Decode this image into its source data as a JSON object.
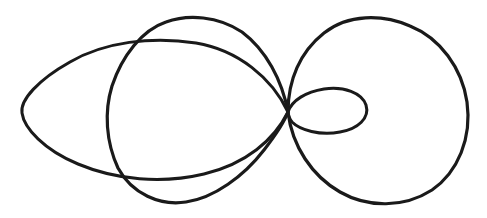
{
  "figure": {
    "kind": "hand-drawn-line-drawing",
    "background_color": "#ffffff",
    "stroke_color": "#1a1a1a",
    "canvas": {
      "width": 487,
      "height": 218
    },
    "node_point": {
      "x": 288,
      "y": 112
    },
    "curves": [
      {
        "name": "wide-flat-oval",
        "role": "leftmost large flattened oval tapering to the node",
        "stroke_width": 3.0,
        "bbox": {
          "x_min": 22,
          "y_min": 43,
          "x_max": 288,
          "y_max": 178
        },
        "path": "M 288 112 C 272 78 238 50 196 43 C 152 36 104 42 70 62 C 38 80 20 100 22 113 C 24 128 44 150 78 164 C 116 180 162 184 204 174 C 246 164 274 140 288 112 Z"
      },
      {
        "name": "egg-teardrop-curve",
        "role": "middle egg shape, rounded at left and pointed at the node",
        "stroke_width": 3.2,
        "bbox": {
          "x_min": 108,
          "y_min": 18,
          "x_max": 288,
          "y_max": 202
        },
        "path": "M 288 112 C 282 80 266 50 242 32 C 218 16 188 14 166 22 C 142 30 122 56 112 86 C 104 112 106 142 118 168 C 132 194 160 206 186 202 C 214 198 244 176 264 150 C 278 132 285 120 288 112 Z"
      },
      {
        "name": "large-right-circle",
        "role": "large circle on the right, tangent at the node",
        "stroke_width": 3.2,
        "bbox": {
          "x_min": 288,
          "y_min": 19,
          "x_max": 468,
          "y_max": 202
        },
        "path": "M 288 112 C 288 80 300 52 324 33 C 348 14 382 14 410 26 C 440 38 462 68 467 102 C 472 138 458 172 432 190 C 404 208 368 208 340 192 C 312 176 292 146 288 112 Z"
      },
      {
        "name": "small-inner-ellipse",
        "role": "small ellipse inside the right circle, touching the node",
        "stroke_width": 3.0,
        "bbox": {
          "x_min": 288,
          "y_min": 88,
          "x_max": 367,
          "y_max": 133
        },
        "path": "M 288 112 C 292 100 306 92 324 89 C 344 86 362 93 366 105 C 370 118 358 129 340 132 C 320 136 300 130 292 122 C 289 118 288 115 288 112 Z"
      }
    ]
  }
}
